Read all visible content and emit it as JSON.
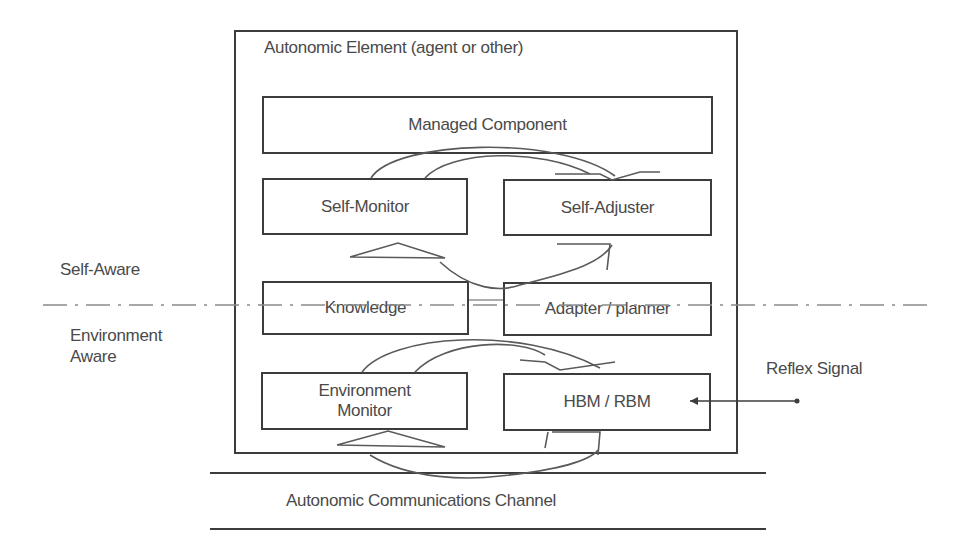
{
  "diagram": {
    "outer_container": {
      "title": "Autonomic Element (agent or other)"
    },
    "components": [
      {
        "id": "managed-component",
        "label": "Managed Component"
      },
      {
        "id": "self-monitor",
        "label": "Self-Monitor"
      },
      {
        "id": "self-adjuster",
        "label": "Self-Adjuster"
      },
      {
        "id": "knowledge",
        "label": "Knowledge"
      },
      {
        "id": "adapter-planner",
        "label": "Adapter / planner"
      },
      {
        "id": "environment-monitor",
        "label": "Environment Monitor"
      },
      {
        "id": "hbm-rbm",
        "label": "HBM / RBM"
      }
    ],
    "side_labels": {
      "self_aware": "Self-Aware",
      "environment_aware": "Environment Aware",
      "reflex_signal": "Reflex Signal"
    },
    "channel": {
      "label": "Autonomic Communications Channel"
    },
    "colors": {
      "line": "#3c3c3c",
      "text": "#4a4a4a",
      "background": "#ffffff"
    }
  }
}
